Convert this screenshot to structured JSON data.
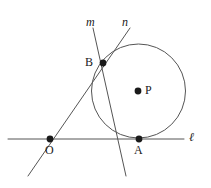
{
  "figure": {
    "type": "euclidean-geometry-diagram",
    "canvas": {
      "width": 211,
      "height": 188
    },
    "colors": {
      "stroke": "#555555",
      "point_fill": "#1a1a1a",
      "label_text": "#1a1a1a",
      "background": "#ffffff"
    },
    "labels": {
      "line_m": "m",
      "line_n": "n",
      "line_l": "ℓ",
      "point_B": "B",
      "point_O": "O",
      "point_A": "A",
      "point_P": "P"
    },
    "points": [
      {
        "name": "B",
        "label": "B",
        "x": 103,
        "y": 63,
        "label_x": 85,
        "label_y": 57,
        "radius": 3.4
      },
      {
        "name": "O",
        "label": "O",
        "x": 50,
        "y": 139,
        "label_x": 45,
        "label_y": 144,
        "radius": 3.4
      },
      {
        "name": "A",
        "label": "A",
        "x": 139,
        "y": 139,
        "label_x": 134,
        "label_y": 144,
        "radius": 3.4
      },
      {
        "name": "P",
        "label": "P",
        "x": 138,
        "y": 91,
        "label_x": 145,
        "label_y": 85,
        "radius": 3.4
      }
    ],
    "circle": {
      "center_x": 138.5,
      "center_y": 91.0,
      "radius": 47.0
    },
    "lines": [
      {
        "name": "l",
        "label": "ℓ",
        "x1": 8,
        "y1": 139,
        "x2": 184,
        "y2": 139,
        "label_x": 189,
        "label_y": 131
      },
      {
        "name": "m",
        "label": "m",
        "x1": 93,
        "y1": 28,
        "x2": 126,
        "y2": 176,
        "label_x": 86,
        "label_y": 16
      },
      {
        "name": "n",
        "label": "n",
        "x1": 130,
        "y1": 28,
        "x2": 28,
        "y2": 176,
        "label_x": 122,
        "label_y": 16
      }
    ]
  }
}
